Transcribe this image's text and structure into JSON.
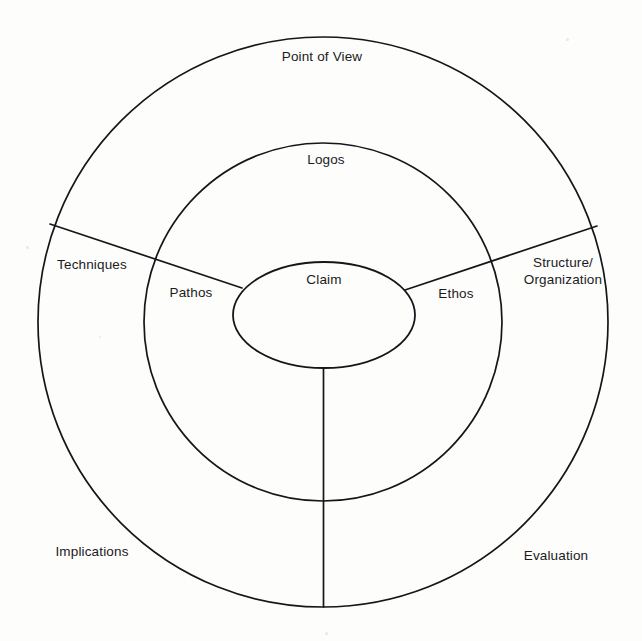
{
  "diagram": {
    "type": "concentric-circle-segmented",
    "background_color": "#fdfdfc",
    "stroke_color": "#15161a",
    "text_color": "#1b1b1b",
    "geometry": {
      "center_x": 323,
      "center_y": 322,
      "outer_radius": 285,
      "middle_radius": 179,
      "core_ellipse_rx": 91,
      "core_ellipse_ry": 53,
      "core_ellipse_cx": 324,
      "core_ellipse_cy": 315,
      "radial_divider_count": 3,
      "radial_angles_deg": [
        160,
        20,
        270
      ]
    },
    "rings": [
      {
        "name": "core",
        "shape": "ellipse",
        "labels": [
          {
            "id": "claim",
            "text": "Claim",
            "x": 324,
            "y": 280
          }
        ]
      },
      {
        "name": "inner-ring",
        "shape": "circle",
        "labels": [
          {
            "id": "logos",
            "text": "Logos",
            "x": 326,
            "y": 160
          },
          {
            "id": "pathos",
            "text": "Pathos",
            "x": 191,
            "y": 293
          },
          {
            "id": "ethos",
            "text": "Ethos",
            "x": 456,
            "y": 294
          }
        ]
      },
      {
        "name": "outer-ring",
        "shape": "circle",
        "labels": [
          {
            "id": "point-of-view",
            "text": "Point of View",
            "x": 322,
            "y": 57
          },
          {
            "id": "techniques",
            "text": "Techniques",
            "x": 92,
            "y": 265
          },
          {
            "id": "structure-organization",
            "text": "Structure/\nOrganization",
            "line1": "Structure/",
            "line2": "Organization",
            "x": 563,
            "y": 272
          },
          {
            "id": "implications",
            "text": "Implications",
            "x": 92,
            "y": 552
          },
          {
            "id": "evaluation",
            "text": "Evaluation",
            "x": 556,
            "y": 556
          }
        ]
      }
    ],
    "labels": {
      "claim": "Claim",
      "logos": "Logos",
      "pathos": "Pathos",
      "ethos": "Ethos",
      "point_of_view": "Point of View",
      "techniques": "Techniques",
      "structure_line1": "Structure/",
      "structure_line2": "Organization",
      "implications": "Implications",
      "evaluation": "Evaluation"
    }
  }
}
